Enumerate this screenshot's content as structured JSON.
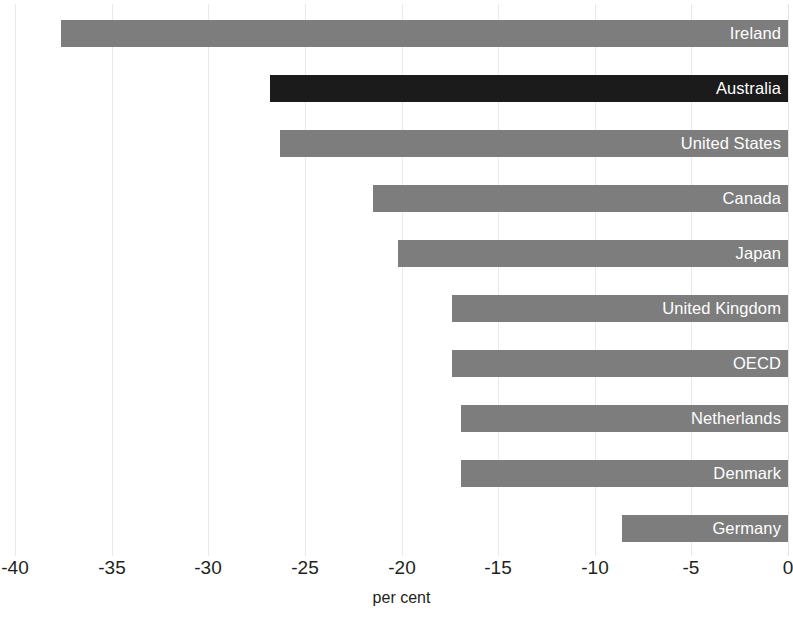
{
  "chart_data": {
    "type": "bar",
    "orientation": "horizontal",
    "title": "",
    "subtitle": "",
    "xlabel": "per cent",
    "ylabel": "",
    "xlim": [
      -40,
      0
    ],
    "xticks": [
      -40,
      -35,
      -30,
      -25,
      -20,
      -15,
      -10,
      -5,
      0
    ],
    "xtick_labels": [
      "-40",
      "-35",
      "-30",
      "-25",
      "-20",
      "-15",
      "-10",
      "-5",
      "0"
    ],
    "grid": true,
    "grid_axis": "x",
    "legend": false,
    "legend_position": "none",
    "categories": [
      "Ireland",
      "Australia",
      "United States",
      "Canada",
      "Japan",
      "United Kingdom",
      "OECD",
      "Netherlands",
      "Denmark",
      "Germany"
    ],
    "values": [
      -37.6,
      -26.8,
      -26.3,
      -21.5,
      -20.2,
      -17.4,
      -17.4,
      -16.9,
      -16.9,
      -8.6
    ],
    "bars": [
      {
        "label": "Ireland",
        "value": -37.6,
        "highlight": false
      },
      {
        "label": "Australia",
        "value": -26.8,
        "highlight": true
      },
      {
        "label": "United States",
        "value": -26.3,
        "highlight": false
      },
      {
        "label": "Canada",
        "value": -21.5,
        "highlight": false
      },
      {
        "label": "Japan",
        "value": -20.2,
        "highlight": false
      },
      {
        "label": "United Kingdom",
        "value": -17.4,
        "highlight": false
      },
      {
        "label": "OECD",
        "value": -17.4,
        "highlight": false
      },
      {
        "label": "Netherlands",
        "value": -16.9,
        "highlight": false
      },
      {
        "label": "Denmark",
        "value": -16.9,
        "highlight": false
      },
      {
        "label": "Germany",
        "value": -8.6,
        "highlight": false
      }
    ],
    "colors": {
      "bar": "#7d7d7d",
      "bar_highlight": "#1b1b1b",
      "bar_label_text": "#ffffff",
      "gridline": "#e9e9ea",
      "axis_text": "#231f20",
      "background": "#ffffff"
    }
  }
}
